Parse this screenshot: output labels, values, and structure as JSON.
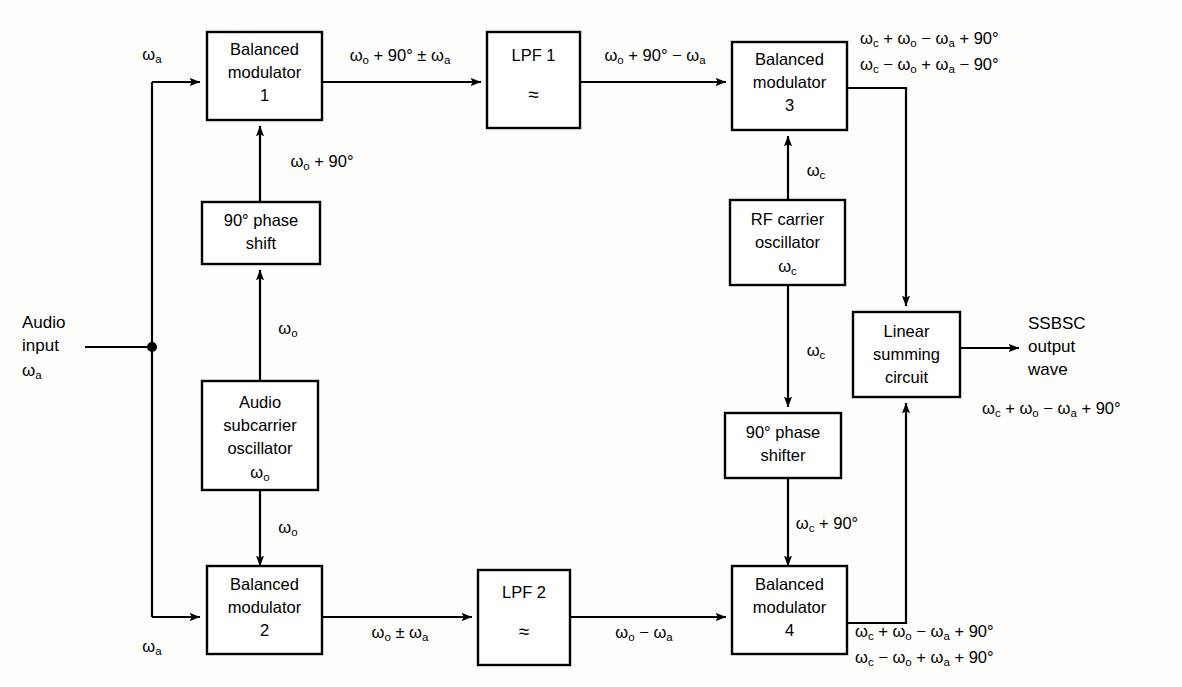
{
  "figure": {
    "kind": "block-diagram",
    "line_color": "#000000",
    "background_color": "#fdfdfb"
  },
  "blocks": {
    "balanced_modulator_1": {
      "line1": "Balanced",
      "line2": "modulator",
      "line3": "1"
    },
    "lpf_1": {
      "line1": "LPF 1",
      "symbol": "≈"
    },
    "balanced_modulator_3": {
      "line1": "Balanced",
      "line2": "modulator",
      "line3": "3"
    },
    "phase_shift_90_audio": {
      "line1": "90° phase",
      "line2": "shift"
    },
    "audio_subcarrier_oscillator": {
      "line1": "Audio",
      "line2": "subcarrier",
      "line3": "oscillator",
      "line4": "ωo"
    },
    "rf_carrier_oscillator": {
      "line1": "RF carrier",
      "line2": "oscillator",
      "line3": "ωc"
    },
    "phase_shifter_90_rf": {
      "line1": "90° phase",
      "line2": "shifter"
    },
    "linear_summing_circuit": {
      "line1": "Linear",
      "line2": "summing",
      "line3": "circuit"
    },
    "balanced_modulator_2": {
      "line1": "Balanced",
      "line2": "modulator",
      "line3": "2"
    },
    "lpf_2": {
      "line1": "LPF 2",
      "symbol": "≈"
    },
    "balanced_modulator_4": {
      "line1": "Balanced",
      "line2": "modulator",
      "line3": "4"
    }
  },
  "io": {
    "audio_input_line1": "Audio",
    "audio_input_line2": "input",
    "audio_input_line3": "ωa",
    "output_line1": "SSBSC",
    "output_line2": "output",
    "output_line3": "wave",
    "output_expression": "ωc + ωo − ωa + 90°"
  },
  "signal_labels": {
    "audio_to_bm1": "ωa",
    "audio_to_bm2": "ωa",
    "bm1_out": "ωo + 90° ± ωa",
    "lpf1_out": "ωo + 90° − ωa",
    "phase_shift_out": "ωo + 90°",
    "osc_to_phase_shift": "ωo",
    "osc_to_bm2": "ωo",
    "bm2_out": "ωo ± ωa",
    "lpf2_out": "ωo − ωa",
    "rf_osc_to_bm3": "ωc",
    "rf_osc_to_shifter": "ωc",
    "shifter_to_bm4": "ωc + 90°",
    "bm3_out_line1": "ωc + ωo − ωa + 90°",
    "bm3_out_line2": "ωc − ωo + ωa − 90°",
    "bm4_out_line1": "ωc + ωo − ωa + 90°",
    "bm4_out_line2": "ωc − ωo + ωa + 90°"
  }
}
